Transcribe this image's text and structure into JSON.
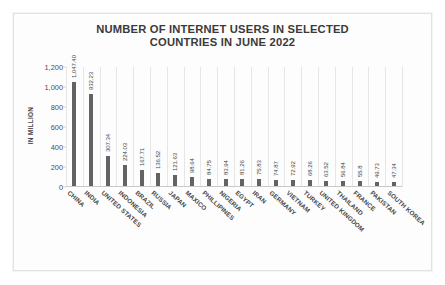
{
  "chart_data": {
    "type": "bar",
    "title": "NUMBER OF INTERNET USERS IN SELECTED COUNTRIES IN JUNE 2022",
    "title_lines": [
      "NUMBER OF INTERNET USERS IN SELECTED",
      "COUNTRIES IN JUNE 2022"
    ],
    "xlabel": "",
    "ylabel": "IN MILLION",
    "ylim": [
      0,
      1200
    ],
    "yticks": [
      0,
      200,
      400,
      600,
      800,
      1000,
      1200
    ],
    "ytick_labels": [
      "0",
      "200",
      "400",
      "600",
      "800",
      "1,000",
      "1,200"
    ],
    "grid": "vertical-category-separators",
    "legend": "none",
    "bar_color": "#636363",
    "categories": [
      "CHINA",
      "INDIA",
      "UNITED STATES",
      "INDONESIA",
      "BRAZIL",
      "RUSSIA",
      "JAPAN",
      "MAXICO",
      "PHILLIPINES",
      "NIGERIA",
      "EGYPT",
      "IRAN",
      "GERMANY",
      "VIETNAM",
      "TURKEY",
      "UNITED KINGDOM",
      "THAILAND",
      "FRANCE",
      "PAKISTAN",
      "SOUTH KOREA"
    ],
    "values": [
      1047.4,
      932.23,
      307.34,
      224.03,
      167.71,
      136.52,
      121.63,
      98.64,
      84.75,
      83.94,
      81.26,
      75.83,
      74.87,
      72.92,
      68.26,
      63.52,
      56.84,
      55.8,
      49.73,
      47.34
    ],
    "data_labels": [
      "1,047.40",
      "932.23",
      "307.34",
      "224.03",
      "167.71",
      "136.52",
      "121.63",
      "98.64",
      "84.75",
      "83.94",
      "81.26",
      "75.83",
      "74.87",
      "72.92",
      "68.26",
      "63.52",
      "56.84",
      "55.8",
      "49.73",
      "47.34"
    ]
  }
}
